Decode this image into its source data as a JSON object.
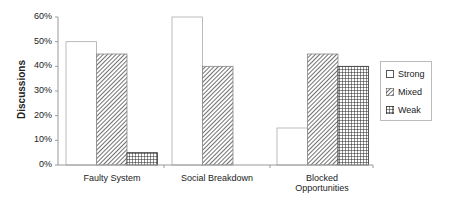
{
  "chart_data": {
    "type": "bar",
    "title": "",
    "xlabel": "",
    "ylabel": "Discussions",
    "ylim": [
      0,
      60
    ],
    "yticks": [
      "0%",
      "10%",
      "20%",
      "30%",
      "40%",
      "50%",
      "60%"
    ],
    "categories": [
      "Faulty System",
      "Social Breakdown",
      "Blocked Opportunities"
    ],
    "series": [
      {
        "name": "Strong",
        "pattern": "empty",
        "values": [
          50,
          60,
          15
        ]
      },
      {
        "name": "Mixed",
        "pattern": "diagonal-hatch",
        "values": [
          45,
          40,
          45
        ]
      },
      {
        "name": "Weak",
        "pattern": "grid",
        "values": [
          5,
          0,
          40
        ]
      }
    ],
    "legend_position": "right",
    "grid": false
  },
  "labels": {
    "ylabel": "Discussions",
    "categories": [
      "Faulty System",
      "Social Breakdown",
      "Blocked",
      "Opportunities"
    ],
    "legend": [
      "Strong",
      "Mixed",
      "Weak"
    ],
    "yticks": [
      "0%",
      "10%",
      "20%",
      "30%",
      "40%",
      "50%",
      "60%"
    ]
  }
}
